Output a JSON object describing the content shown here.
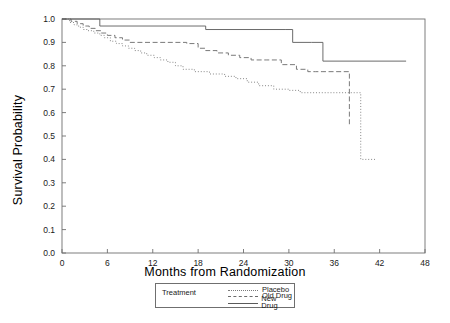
{
  "chart_data": {
    "type": "line",
    "title": "",
    "xlabel": "Months from Randomization",
    "ylabel": "Survival Probability",
    "xlim": [
      0,
      48
    ],
    "ylim": [
      0.0,
      1.0
    ],
    "xticks": [
      0,
      6,
      12,
      18,
      24,
      30,
      36,
      42,
      48
    ],
    "xtick_labels": [
      "0",
      "6",
      "12",
      "18",
      "24",
      "30",
      "36",
      "42",
      "48"
    ],
    "yticks": [
      0.0,
      0.1,
      0.2,
      0.3,
      0.4,
      0.5,
      0.6,
      0.7,
      0.8,
      0.9,
      1.0
    ],
    "ytick_labels": [
      "0.0",
      "0.1",
      "0.2",
      "0.3",
      "0.4",
      "0.5",
      "0.6",
      "0.7",
      "0.8",
      "0.9",
      "1.0"
    ],
    "grid": false,
    "legend_position": "below-axis-center",
    "legend_title": "Treatment",
    "series": [
      {
        "name": "Placebo",
        "style": "dotted",
        "color": "#7a7a7a",
        "x": [
          0,
          1.0,
          1.6,
          2.2,
          2.8,
          3.4,
          4.2,
          5.0,
          5.6,
          6.4,
          7.2,
          8.0,
          8.8,
          9.6,
          10.4,
          11.2,
          12.2,
          13.0,
          14.0,
          15.0,
          16.0,
          17.5,
          19.5,
          21.5,
          23.0,
          24.5,
          26.0,
          28.0,
          30.0,
          31.5,
          33.0,
          34.5,
          36.0,
          39.5,
          41.5
        ],
        "y": [
          1.0,
          0.985,
          0.975,
          0.965,
          0.955,
          0.95,
          0.94,
          0.93,
          0.92,
          0.905,
          0.895,
          0.885,
          0.875,
          0.865,
          0.855,
          0.845,
          0.835,
          0.825,
          0.815,
          0.8,
          0.785,
          0.775,
          0.765,
          0.755,
          0.745,
          0.73,
          0.715,
          0.7,
          0.695,
          0.685,
          0.685,
          0.685,
          0.685,
          0.4,
          0.4
        ]
      },
      {
        "name": "Old Drug",
        "style": "dashed",
        "color": "#6b6b6b",
        "x": [
          0,
          1.2,
          2.0,
          2.8,
          3.6,
          4.4,
          5.2,
          6.0,
          7.0,
          8.0,
          9.0,
          12.0,
          16.5,
          18.0,
          19.0,
          20.5,
          22.0,
          23.5,
          25.0,
          27.0,
          29.0,
          31.0,
          32.5,
          33.5,
          34.5,
          36.0,
          38.0
        ],
        "y": [
          1.0,
          0.99,
          0.98,
          0.97,
          0.96,
          0.95,
          0.94,
          0.93,
          0.92,
          0.91,
          0.9,
          0.9,
          0.895,
          0.875,
          0.865,
          0.855,
          0.845,
          0.835,
          0.825,
          0.825,
          0.805,
          0.785,
          0.775,
          0.775,
          0.775,
          0.775,
          0.545
        ]
      },
      {
        "name": "New Drug",
        "style": "solid",
        "color": "#5a5a5a",
        "x": [
          0,
          1.0,
          4.5,
          5.0,
          18.5,
          19.0,
          29.5,
          30.5,
          33.0,
          34.5,
          45.5
        ],
        "y": [
          1.0,
          1.0,
          1.0,
          0.97,
          0.97,
          0.955,
          0.955,
          0.9,
          0.9,
          0.82,
          0.82
        ]
      }
    ]
  },
  "legend": {
    "title": "Treatment",
    "entries": [
      {
        "label": "Placebo",
        "key": "dotted-line-key"
      },
      {
        "label": "Old Drug",
        "key": "dashed-line-key"
      },
      {
        "label": "New Drug",
        "key": "solid-line-key"
      }
    ]
  },
  "axes": {
    "x_title": "Months from Randomization",
    "y_title": "Survival Probability"
  },
  "colors": {
    "frame": "#6f6f6f",
    "placebo": "#7a7a7a",
    "old_drug": "#6b6b6b",
    "new_drug": "#5a5a5a",
    "text": "#1a1a1a"
  }
}
